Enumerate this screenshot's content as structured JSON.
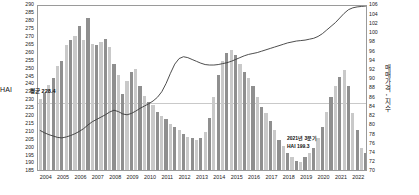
{
  "axes": {
    "left_title": "HAI",
    "right_title": "매매가격 - 지수",
    "left_ticks": [
      290,
      285,
      280,
      275,
      270,
      265,
      260,
      255,
      250,
      245,
      240,
      235,
      230,
      225,
      220,
      215,
      210,
      205,
      200,
      195,
      190,
      185
    ],
    "right_ticks": [
      106,
      104,
      102,
      100,
      98,
      96,
      94,
      92,
      90,
      88,
      86,
      84,
      82,
      80,
      78,
      76,
      74,
      72,
      70
    ],
    "x_ticks": [
      "2004",
      "2005",
      "2006",
      "2007",
      "2008",
      "2009",
      "2010",
      "2011",
      "2012",
      "2013",
      "2014",
      "2015",
      "2016",
      "2017",
      "2018",
      "2019",
      "2020",
      "2021",
      "2022"
    ]
  },
  "annotations": {
    "average_label": "평균 228.4",
    "latest_line1": "2021년 3분기",
    "latest_line2": "HAI 199.3"
  },
  "colors": {
    "bar_light": "#c9c9c9",
    "bar_dark": "#8f8f8f",
    "line": "#3a3a3a",
    "average_rule": "#c9c9c9",
    "frame": "#9a9a9a"
  },
  "chart_data": {
    "type": "bar",
    "title": "",
    "xlabel": "",
    "ylabel": "HAI",
    "y2label": "매매가격 - 지수",
    "ylim": [
      185,
      290
    ],
    "y2lim": [
      70,
      106
    ],
    "grid": false,
    "legend": "none",
    "x_start_year": 2004,
    "x_end_year": 2022,
    "period": "quarterly",
    "average_hai": 228.4,
    "latest": {
      "period": "2021년 3분기",
      "hai": 199.3
    },
    "series": [
      {
        "name": "HAI",
        "type": "bar",
        "axis": "left",
        "values": [
          230,
          234,
          239,
          243,
          251,
          254,
          264,
          267,
          270,
          276,
          267,
          281,
          265,
          264,
          266,
          268,
          263,
          252,
          245,
          233,
          241,
          247,
          249,
          238,
          232,
          228,
          226,
          222,
          219,
          217,
          214,
          212,
          210,
          208,
          206,
          205,
          204,
          205,
          209,
          218,
          231,
          245,
          254,
          259,
          261,
          258,
          252,
          247,
          243,
          238,
          231,
          225,
          221,
          216,
          210,
          204,
          200,
          196,
          193,
          191,
          190,
          193,
          196,
          199,
          205,
          212,
          222,
          231,
          238,
          244,
          248,
          238,
          221,
          210,
          199,
          196
        ]
      },
      {
        "name": "매매가격 - 지수",
        "type": "line",
        "axis": "right",
        "values": [
          79.0,
          78.5,
          78.1,
          77.8,
          77.5,
          77.4,
          77.6,
          77.9,
          78.3,
          78.8,
          79.4,
          80.2,
          80.9,
          81.4,
          81.9,
          82.4,
          83.0,
          83.4,
          83.1,
          82.6,
          82.4,
          82.7,
          83.2,
          83.8,
          84.3,
          84.8,
          85.4,
          86.2,
          87.4,
          89.2,
          91.4,
          93.4,
          94.6,
          95.0,
          94.8,
          94.4,
          94.0,
          93.6,
          93.3,
          93.2,
          93.2,
          93.3,
          93.5,
          93.7,
          94.0,
          94.4,
          94.8,
          95.2,
          95.5,
          95.7,
          95.9,
          96.2,
          96.5,
          96.8,
          97.1,
          97.4,
          97.7,
          98.0,
          98.2,
          98.4,
          98.5,
          98.6,
          98.8,
          99.0,
          99.4,
          100.0,
          100.8,
          101.6,
          102.4,
          103.4,
          104.4,
          105.2,
          105.6,
          105.8,
          105.9,
          106.0
        ]
      }
    ]
  }
}
